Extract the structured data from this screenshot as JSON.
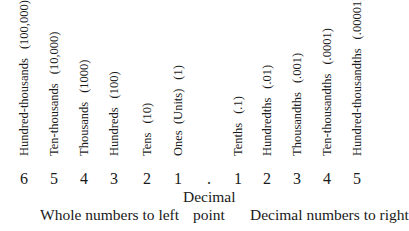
{
  "places": [
    {
      "name": "Hundred-thousands",
      "value": "(100,000)",
      "digit": "6",
      "x": 24
    },
    {
      "name": "Ten-thousands",
      "value": "(10,000)",
      "digit": "5",
      "x": 54
    },
    {
      "name": "Thousands",
      "value": "(1000)",
      "digit": "4",
      "x": 84
    },
    {
      "name": "Hundreds",
      "value": "(100)",
      "digit": "3",
      "x": 114
    },
    {
      "name": "Tens",
      "value": "(10)",
      "digit": "2",
      "x": 147
    },
    {
      "name": "Ones  (Units)",
      "value": "(1)",
      "digit": "1",
      "x": 178
    },
    {
      "name": "Tenths",
      "value": "(.1)",
      "digit": "1",
      "x": 238
    },
    {
      "name": "Hundredths",
      "value": "(.01)",
      "digit": "2",
      "x": 267
    },
    {
      "name": "Thousandths",
      "value": "(.001)",
      "digit": "3",
      "x": 297
    },
    {
      "name": "Ten-thousandths",
      "value": "(.0001)",
      "digit": "4",
      "x": 327
    },
    {
      "name": "Hundred-thousandths",
      "value": "(.00001)",
      "digit": "5",
      "x": 357
    }
  ],
  "decimal_point": {
    "symbol": ".",
    "label_line1": "Decimal",
    "label_line2": "point"
  },
  "captions": {
    "left": "Whole numbers to left",
    "right": "Decimal numbers to right"
  }
}
